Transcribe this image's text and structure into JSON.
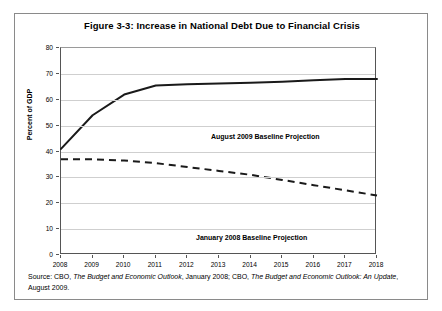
{
  "figure": {
    "title": "Figure 3-3: Increase in National Debt Due to Financial Crisis",
    "source_prefix": "Source: CBO, ",
    "source_pub1": "The Budget and Economic Outlook",
    "source_mid": ", January 2008; CBO, ",
    "source_pub2": "The Budget and Economic Outlook: An Update",
    "source_suffix": ", August 2009."
  },
  "chart_data": {
    "type": "line",
    "title": "Figure 3-3: Increase in National Debt Due to Financial Crisis",
    "xlabel": "",
    "ylabel": "Percent of GDP",
    "x": [
      2008,
      2009,
      2010,
      2011,
      2012,
      2013,
      2014,
      2015,
      2016,
      2017,
      2018
    ],
    "xtick_labels": [
      "2008",
      "2009",
      "2010",
      "2011",
      "2012",
      "2013",
      "2014",
      "2015",
      "2016",
      "2017",
      "2018"
    ],
    "ytick_labels": [
      "0",
      "10",
      "20",
      "30",
      "40",
      "50",
      "60",
      "70",
      "80"
    ],
    "yticks": [
      0,
      10,
      20,
      30,
      40,
      50,
      60,
      70,
      80
    ],
    "ylim": [
      0,
      80
    ],
    "xlim": [
      2008,
      2018
    ],
    "grid": true,
    "legend_position": "inline-annotation",
    "series": [
      {
        "name": "August 2009 Baseline Projection",
        "style": "solid",
        "color": "#1a1a1a",
        "values": [
          41,
          54,
          62,
          65.5,
          66,
          66.3,
          66.6,
          67,
          67.5,
          68,
          68
        ]
      },
      {
        "name": "January 2008 Baseline Projection",
        "style": "dashed",
        "color": "#1a1a1a",
        "values": [
          37,
          37,
          36.5,
          35.5,
          34,
          32.5,
          31,
          29,
          27,
          25,
          23
        ]
      }
    ]
  }
}
